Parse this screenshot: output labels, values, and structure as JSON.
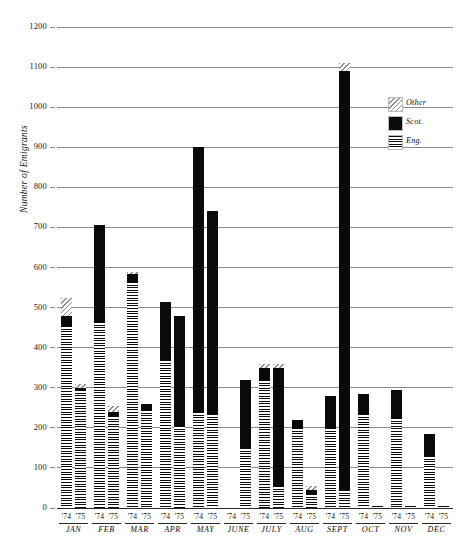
{
  "chart_data": {
    "type": "bar",
    "title": "",
    "subtitle": "",
    "xlabel": "",
    "ylabel": "Number of Emigrants",
    "ylim": [
      0,
      1200
    ],
    "ytick_step": 100,
    "yticks": [
      0,
      100,
      200,
      300,
      400,
      500,
      600,
      700,
      800,
      900,
      1000,
      1100,
      1200
    ],
    "ytick_labels": [
      "0",
      "100",
      "200",
      "300",
      "400",
      "500",
      "600",
      "700",
      "800",
      "900",
      "1000",
      "1100",
      "1200"
    ],
    "grid": true,
    "grid_axis": "y",
    "stacked": true,
    "legend_position": "upper-right",
    "categories": [
      "JAN",
      "FEB",
      "MAR",
      "APR",
      "MAY",
      "JUNE",
      "JULY",
      "AUG",
      "SEPT",
      "OCT",
      "NOV",
      "DEC"
    ],
    "group_labels": [
      "'74",
      "'75"
    ],
    "series": [
      {
        "name": "Eng.",
        "fill": "horizontal-stripes",
        "color": "#9a9a9a",
        "values_74": [
          455,
          465,
          565,
          370,
          240,
          0,
          320,
          200,
          200,
          235,
          225,
          130
        ],
        "values_75": [
          295,
          230,
          245,
          205,
          235,
          150,
          55,
          35,
          45,
          5,
          5,
          5
        ]
      },
      {
        "name": "Scot.",
        "fill": "solid-black",
        "color": "#0a0a0a",
        "values_74": [
          25,
          240,
          20,
          145,
          660,
          0,
          30,
          20,
          80,
          50,
          70,
          55
        ],
        "values_75": [
          5,
          10,
          15,
          275,
          505,
          170,
          295,
          10,
          1045,
          0,
          0,
          0
        ]
      },
      {
        "name": "Other",
        "fill": "diagonal-hatch",
        "color": "#8f8f8f",
        "values_74": [
          45,
          0,
          5,
          0,
          0,
          0,
          10,
          0,
          0,
          0,
          0,
          0
        ],
        "values_75": [
          10,
          15,
          0,
          0,
          0,
          0,
          10,
          10,
          20,
          0,
          0,
          0
        ]
      }
    ],
    "totals_74": [
      525,
      705,
      590,
      515,
      900,
      0,
      360,
      220,
      280,
      285,
      295,
      185
    ],
    "totals_75": [
      310,
      255,
      260,
      480,
      740,
      320,
      360,
      55,
      1110,
      5,
      5,
      5
    ]
  },
  "legend": {
    "items": [
      {
        "label": "Other",
        "swatch": "diagonal-hatch"
      },
      {
        "label": "Scot.",
        "swatch": "solid-black"
      },
      {
        "label": "Eng.",
        "swatch": "horizontal-stripes"
      }
    ]
  },
  "axis": {
    "y_title": "Number of Emigrants"
  }
}
